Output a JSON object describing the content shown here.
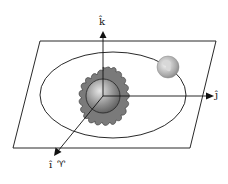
{
  "diagram": {
    "axes": {
      "k_label": "k̂",
      "j_label": "ĵ",
      "i_label": "î",
      "i_symbol": "♈"
    },
    "objects": [
      "sun",
      "earth",
      "orbit",
      "ecliptic-plane"
    ],
    "colors": {
      "line": "#111111",
      "sun_flame": "#7a7a7a",
      "sun_body": "#9a9a9a",
      "earth": "#b8b8b8",
      "background": "#ffffff"
    }
  }
}
